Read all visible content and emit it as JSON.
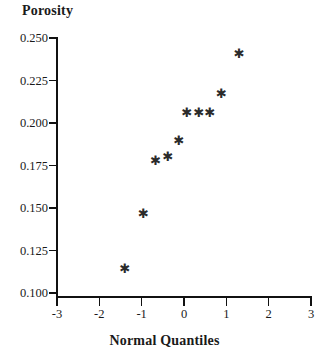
{
  "chart_data": {
    "type": "scatter",
    "title": "",
    "xlabel": "Normal Quantiles",
    "ylabel": "Porosity",
    "xlim": [
      -3,
      3
    ],
    "ylim": [
      0.1,
      0.25
    ],
    "grid": false,
    "legend": null,
    "marker": "asterisk",
    "marker_glyph": "✱",
    "marker_color": "#2b2b2b",
    "axis_color": "#111111",
    "background_color": "#ffffff",
    "xticks": [
      -3,
      -2,
      -1,
      0,
      1,
      2,
      3
    ],
    "xtick_labels": [
      "-3",
      "-2",
      "-1",
      "0",
      "1",
      "2",
      "3"
    ],
    "yticks": [
      0.1,
      0.125,
      0.15,
      0.175,
      0.2,
      0.225,
      0.25
    ],
    "ytick_labels": [
      "0.100",
      "0.125",
      "0.150",
      "0.175",
      "0.200",
      "0.225",
      "0.250"
    ],
    "points": [
      {
        "x": -1.42,
        "y": 0.1141
      },
      {
        "x": -0.98,
        "y": 0.1459
      },
      {
        "x": -0.69,
        "y": 0.1771
      },
      {
        "x": -0.4,
        "y": 0.1799
      },
      {
        "x": -0.14,
        "y": 0.1889
      },
      {
        "x": 0.05,
        "y": 0.2057
      },
      {
        "x": 0.33,
        "y": 0.2057
      },
      {
        "x": 0.59,
        "y": 0.2057
      },
      {
        "x": 0.86,
        "y": 0.2165
      },
      {
        "x": 1.28,
        "y": 0.2404
      }
    ]
  },
  "layout": {
    "plot_left_px": 57,
    "plot_right_px": 311,
    "plot_top_px": 38,
    "plot_bottom_px": 293
  }
}
